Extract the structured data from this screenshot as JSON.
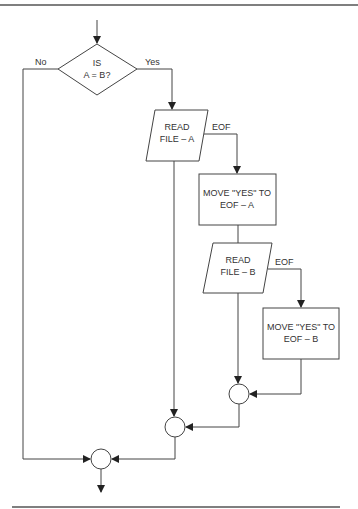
{
  "flowchart": {
    "decision": {
      "line1": "IS",
      "line2": "A = B?"
    },
    "branch_no": "No",
    "branch_yes": "Yes",
    "read_a": {
      "line1": "READ",
      "line2": "FILE – A"
    },
    "eof_a": "EOF",
    "move_a": {
      "line1": "MOVE \"YES\" TO",
      "line2": "EOF – A"
    },
    "read_b": {
      "line1": "READ",
      "line2": "FILE – B"
    },
    "eof_b": "EOF",
    "move_b": {
      "line1": "MOVE \"YES\" TO",
      "line2": "EOF – B"
    }
  },
  "colors": {
    "line": "#444444",
    "text": "#333333",
    "background": "#ffffff"
  }
}
